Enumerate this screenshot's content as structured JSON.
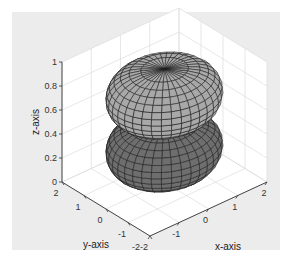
{
  "chart_data": {
    "type": "surface3d",
    "title": "",
    "xlabel": "x-axis",
    "ylabel": "y-axis",
    "zlabel": "z-axis",
    "xlim": [
      -2,
      2
    ],
    "ylim": [
      -2,
      2
    ],
    "zlim": [
      0,
      1
    ],
    "xticks": [
      "-2",
      "-1",
      "0",
      "1",
      "2"
    ],
    "yticks": [
      "-2",
      "-1",
      "0",
      "1",
      "2"
    ],
    "zticks": [
      "0",
      "0.2",
      "0.4",
      "0.6",
      "0.8",
      "1"
    ],
    "grid": true,
    "series": [
      {
        "name": "upper-surface",
        "shape": "oblate spheroid cap",
        "z_center": 0.72,
        "radius_xy": 1.6,
        "color": "#a8a8a8"
      },
      {
        "name": "lower-surface",
        "shape": "oblate spheroid cap",
        "z_center": 0.28,
        "radius_xy": 1.6,
        "color": "#6e6e6e"
      }
    ],
    "legend": null
  },
  "colors": {
    "figure_bg": "#ececec",
    "axes_bg": "#ffffff",
    "upper_surface": "#a8a8a8",
    "lower_surface": "#6e6e6e",
    "mesh_line": "#1a1a1a"
  }
}
